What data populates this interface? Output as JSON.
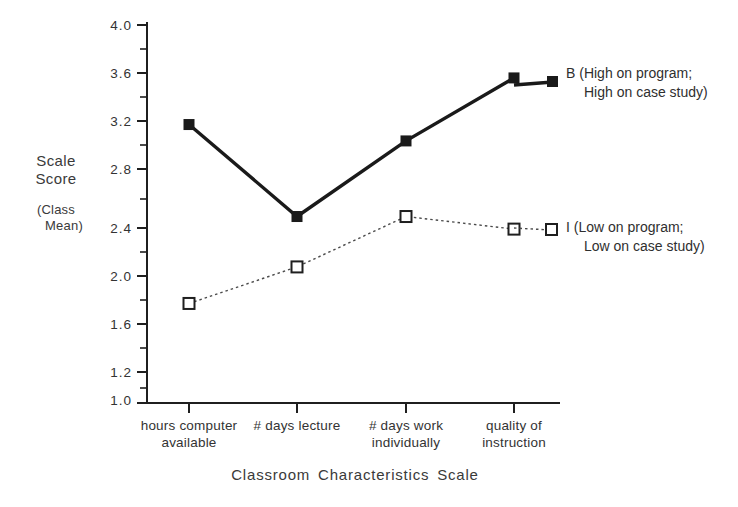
{
  "chart_data": {
    "type": "line",
    "title": "",
    "xlabel": "Classroom  Characteristics  Scale",
    "ylabel": "Scale Score",
    "ylabel_sub": "(Class Mean)",
    "ylabel_lines": [
      "Scale",
      "Score"
    ],
    "ylabel_sub_lines": [
      "(Class",
      "Mean)"
    ],
    "ylim": [
      1.0,
      4.0
    ],
    "ytick_labels": [
      "4.0",
      "3.6",
      "3.2",
      "2.8",
      "2.4",
      "2.0",
      "1.6",
      "1.2",
      "1.0"
    ],
    "ytick_values": [
      4.0,
      3.6,
      3.2,
      2.8,
      2.4,
      2.0,
      1.6,
      1.2,
      1.0
    ],
    "yminor_values": [
      3.8,
      3.4,
      3.0,
      2.6,
      2.2,
      1.8,
      1.4
    ],
    "grid": false,
    "legend_position": "right-inline",
    "categories": [
      "hours computer available",
      "# days lecture",
      "# days work individually",
      "quality of instruction"
    ],
    "category_lines": [
      [
        "hours computer",
        "available"
      ],
      [
        "# days lecture",
        ""
      ],
      [
        "# days work",
        "individually"
      ],
      [
        "quality of",
        "instruction"
      ]
    ],
    "series": [
      {
        "name": "B",
        "legend_lines": [
          "B (High on program;",
          "High on case study)"
        ],
        "marker": "filled-square",
        "line_style": "solid",
        "color": "#1a1a1a",
        "values": [
          3.21,
          2.48,
          3.08,
          3.58
        ]
      },
      {
        "name": "I",
        "legend_lines": [
          "I (Low on program;",
          "Low on case study)"
        ],
        "marker": "open-square",
        "line_style": "dotted",
        "color": "#4a4a4a",
        "values": [
          1.79,
          2.08,
          2.48,
          2.38
        ]
      }
    ]
  },
  "axis": {
    "y_axis_name": "scale-score-axis",
    "x_axis_name": "classroom-characteristics-axis"
  }
}
